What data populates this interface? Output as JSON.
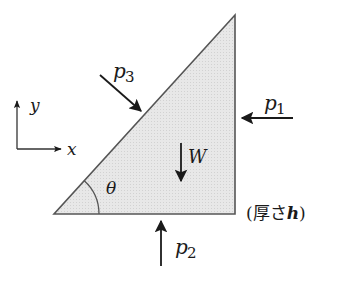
{
  "diagram": {
    "title": "",
    "colors": {
      "triangle_fill": "#e6e6e6",
      "triangle_stroke": "#555555",
      "arrow": "#1a1a1a"
    },
    "triangle": {
      "vertices": [
        [
          54,
          214
        ],
        [
          235,
          214
        ],
        [
          235,
          15
        ]
      ],
      "angle_label": "θ"
    },
    "axes": {
      "x_label": "x",
      "y_label": "y"
    },
    "forces": {
      "p1": {
        "symbol": "p",
        "subscript": "1",
        "direction": "left"
      },
      "p2": {
        "symbol": "p",
        "subscript": "2",
        "direction": "up"
      },
      "p3": {
        "symbol": "p",
        "subscript": "3",
        "direction": "down-right"
      },
      "W": {
        "symbol": "W",
        "direction": "down"
      }
    },
    "note": {
      "open": "(厚さ",
      "var": "h",
      "close": ")"
    }
  }
}
